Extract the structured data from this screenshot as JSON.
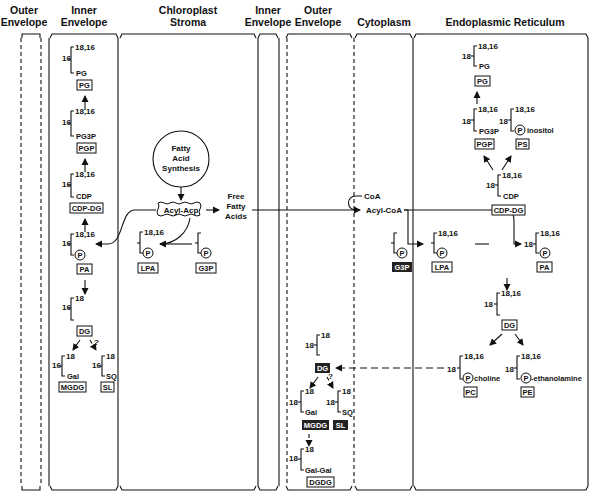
{
  "compartments": [
    {
      "id": "outer-envelope-left",
      "label_line1": "Outer",
      "label_line2": "Envelope",
      "border": "dashed"
    },
    {
      "id": "inner-envelope-left",
      "label_line1": "Inner",
      "label_line2": "Envelope",
      "border": "solid"
    },
    {
      "id": "chloroplast-stroma",
      "label_line1": "Chloroplast",
      "label_line2": "Stroma",
      "border": "solid"
    },
    {
      "id": "inner-envelope-right",
      "label_line1": "Inner",
      "label_line2": "Envelope",
      "border": "solid"
    },
    {
      "id": "outer-envelope-right",
      "label_line1": "Outer",
      "label_line2": "Envelope",
      "border": "dashed"
    },
    {
      "id": "cytoplasm",
      "label_line1": "Cytoplasm",
      "label_line2": "",
      "border": "dashed"
    },
    {
      "id": "endoplasmic-reticulum",
      "label_line1": "Endoplasmic Reticulum",
      "label_line2": "",
      "border": "solid"
    }
  ],
  "chloroplast_inner_envelope": {
    "pg": {
      "pos1": "16",
      "pos2": "18,16",
      "headgroup": "PG",
      "name": "PG"
    },
    "pgp": {
      "pos1": "16",
      "pos2": "18,16",
      "headgroup": "PG3P",
      "name": "PGP"
    },
    "cdpdg": {
      "pos1": "16",
      "pos2": "18,16",
      "headgroup": "CDP",
      "name": "CDP-DG"
    },
    "pa": {
      "pos1": "16",
      "pos2": "18,16",
      "headgroup": "P",
      "name": "PA"
    },
    "dg": {
      "pos1": "16",
      "pos2": "18",
      "name": "DG"
    },
    "question": "?",
    "mgdg": {
      "pos1": "16",
      "pos2": "18",
      "headgroup": "Gal",
      "name": "MGDG"
    },
    "sl": {
      "pos1": "16",
      "pos2": "18",
      "headgroup": "SQ",
      "name": "SL"
    }
  },
  "stroma": {
    "fatty_acid_synthesis": [
      "Fatty",
      "Acid",
      "Synthesis"
    ],
    "acyl_acp": "Acyl-Acp",
    "free_fatty_acids": [
      "Free",
      "Fatty",
      "Acids"
    ],
    "lpa": {
      "pos2": "18,16",
      "headgroup": "P",
      "name": "LPA"
    },
    "g3p": {
      "headgroup": "P",
      "name": "G3P"
    }
  },
  "outer_envelope_right": {
    "dg": {
      "pos1": "18",
      "pos2": "18",
      "name": "DG"
    },
    "question": "?",
    "mgdg": {
      "pos1": "18",
      "pos2": "18",
      "headgroup": "Gal",
      "name": "MGDG"
    },
    "sl": {
      "pos1": "18",
      "pos2": "18",
      "headgroup": "SQ",
      "name": "SL"
    },
    "dgdg": {
      "pos1": "18",
      "pos2": "18",
      "headgroup": "Gal-Gal",
      "name": "DGDG"
    }
  },
  "cytoplasm": {
    "coa": "CoA",
    "acyl_coa": "Acyl-CoA",
    "g3p": {
      "headgroup": "P",
      "name": "G3P"
    }
  },
  "endoplasmic_reticulum": {
    "pg": {
      "pos1": "18",
      "pos2": "18,16",
      "headgroup": "PG",
      "name": "PG"
    },
    "pgp": {
      "pos1": "18",
      "pos2": "18,16",
      "headgroup": "PG3P",
      "name": "PGP"
    },
    "ps": {
      "pos1": "18",
      "pos2": "18,16",
      "headgroup": "P",
      "headgroup_suffix": "inositol",
      "name": "PS"
    },
    "cdpdg": {
      "pos1": "18",
      "pos2": "18,16",
      "headgroup": "CDP",
      "name": "CDP-DG"
    },
    "lpa": {
      "pos2": "18,16",
      "headgroup": "P",
      "name": "LPA"
    },
    "pa": {
      "pos1": "18",
      "pos2": "18,16",
      "headgroup": "P",
      "name": "PA"
    },
    "dg": {
      "pos1": "18",
      "pos2": "18,16",
      "name": "DG"
    },
    "pc": {
      "pos1": "18",
      "pos2": "18,16",
      "headgroup": "P",
      "headgroup_suffix": "choline",
      "name": "PC"
    },
    "pe": {
      "pos1": "18",
      "pos2": "18,16",
      "headgroup": "P",
      "headgroup_suffix": "-ethanolamine",
      "name": "PE"
    }
  }
}
